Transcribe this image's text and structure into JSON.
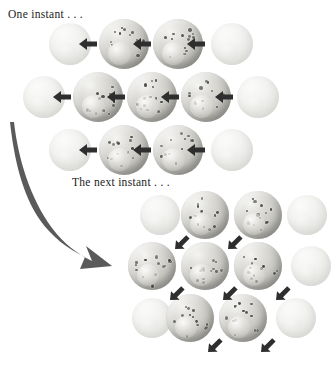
{
  "figure": {
    "title_visible": false,
    "background_color": "#ffffff",
    "width": 335,
    "height": 368
  },
  "captions": {
    "first_state": "One instant . . .",
    "second_state": "The next instant . . ."
  },
  "colors": {
    "sphere_light": "#f4f4f2",
    "sphere_mid": "#c9c8c3",
    "sphere_dark": "#8e8d89",
    "speckle": "#4a4a46",
    "arrow": "#2e2e2e",
    "curved_arrow": "#555555",
    "faded_sphere": "#eeeeec",
    "text": "#1c1c1c"
  },
  "icons": {
    "left_arrow": "arrow-left",
    "diagonal_arrow": "arrow-down-left",
    "curved_arrow": "curved-arrow-down-right"
  },
  "clusters": [
    {
      "id": "upper-lattice",
      "label": "One instant . . .",
      "arrow_direction": "left",
      "rows": [
        {
          "y": 44,
          "spheres": [
            {
              "x": 70,
              "r": 21,
              "faded": true
            },
            {
              "x": 124,
              "r": 25,
              "faded": false
            },
            {
              "x": 178,
              "r": 25,
              "faded": false
            },
            {
              "x": 232,
              "r": 21,
              "faded": true
            }
          ],
          "arrows": [
            {
              "x": 88
            },
            {
              "x": 142
            },
            {
              "x": 196
            }
          ]
        },
        {
          "y": 97,
          "spheres": [
            {
              "x": 44,
              "r": 21,
              "faded": true
            },
            {
              "x": 98,
              "r": 25,
              "faded": false
            },
            {
              "x": 152,
              "r": 25,
              "faded": false
            },
            {
              "x": 206,
              "r": 25,
              "faded": false
            },
            {
              "x": 258,
              "r": 21,
              "faded": true
            }
          ],
          "arrows": [
            {
              "x": 62
            },
            {
              "x": 116
            },
            {
              "x": 170
            },
            {
              "x": 224
            }
          ]
        },
        {
          "y": 150,
          "spheres": [
            {
              "x": 70,
              "r": 21,
              "faded": true
            },
            {
              "x": 124,
              "r": 25,
              "faded": false
            },
            {
              "x": 178,
              "r": 25,
              "faded": false
            },
            {
              "x": 232,
              "r": 21,
              "faded": true
            }
          ],
          "arrows": [
            {
              "x": 88
            },
            {
              "x": 142
            },
            {
              "x": 196
            }
          ]
        }
      ]
    },
    {
      "id": "lower-lattice",
      "label": "The next instant . . .",
      "arrow_direction": "down-left",
      "rows": [
        {
          "y": 215,
          "spheres": [
            {
              "x": 160,
              "r": 20,
              "faded": true
            },
            {
              "x": 205,
              "r": 24,
              "faded": false
            },
            {
              "x": 258,
              "r": 24,
              "faded": false
            },
            {
              "x": 307,
              "r": 20,
              "faded": true
            }
          ],
          "arrows": [
            {
              "x": 183
            },
            {
              "x": 236
            }
          ]
        },
        {
          "y": 266,
          "spheres": [
            {
              "x": 152,
              "r": 24,
              "faded": false
            },
            {
              "x": 205,
              "r": 24,
              "faded": false
            },
            {
              "x": 258,
              "r": 24,
              "faded": false
            },
            {
              "x": 311,
              "r": 20,
              "faded": true
            }
          ],
          "arrows": [
            {
              "x": 178
            },
            {
              "x": 231
            },
            {
              "x": 284
            }
          ]
        },
        {
          "y": 318,
          "spheres": [
            {
              "x": 152,
              "r": 20,
              "faded": true
            },
            {
              "x": 190,
              "r": 24,
              "faded": false
            },
            {
              "x": 243,
              "r": 24,
              "faded": false
            },
            {
              "x": 296,
              "r": 20,
              "faded": true
            }
          ],
          "arrows": [
            {
              "x": 216
            },
            {
              "x": 269
            }
          ]
        }
      ]
    }
  ],
  "transition_arrow": {
    "name": "curved-arrow-down-right",
    "from": "upper-lattice",
    "to": "lower-lattice"
  }
}
